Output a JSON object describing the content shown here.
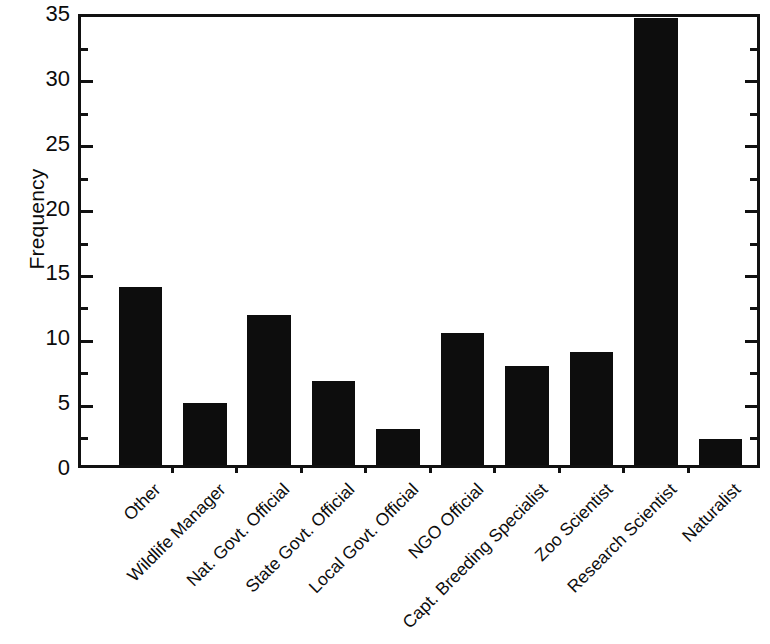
{
  "chart_data": {
    "type": "bar",
    "title": "",
    "subtitle": "",
    "xlabel": "",
    "ylabel": "Frequency",
    "categories": [
      "Other",
      "Wildlife Manager",
      "Nat. Govt. Official",
      "State Govt. Official",
      "Local Govt. Official",
      "NGO Official",
      "Capt. Breeding Specialist",
      "Zoo Scientist",
      "Research Scientist",
      "Naturalist"
    ],
    "values": [
      13.7,
      4.8,
      11.6,
      6.5,
      2.8,
      10.2,
      7.6,
      8.7,
      34.5,
      2.0
    ],
    "ylim": [
      0,
      35
    ],
    "y_major_ticks": [
      0,
      5,
      10,
      15,
      20,
      25,
      30,
      35
    ],
    "y_minor_ticks": [
      2.5,
      7.5,
      12.5,
      17.5,
      22.5,
      27.5,
      32.5
    ],
    "y_tick_labels": [
      "0",
      "5",
      "10",
      "15",
      "20",
      "25",
      "30",
      "35"
    ],
    "grid": false,
    "legend": false,
    "legend_position": "none",
    "bar_color": "#0d0d0d",
    "axis_color": "#111111",
    "background_color": "#ffffff",
    "x_label_rotation_deg": -45
  }
}
